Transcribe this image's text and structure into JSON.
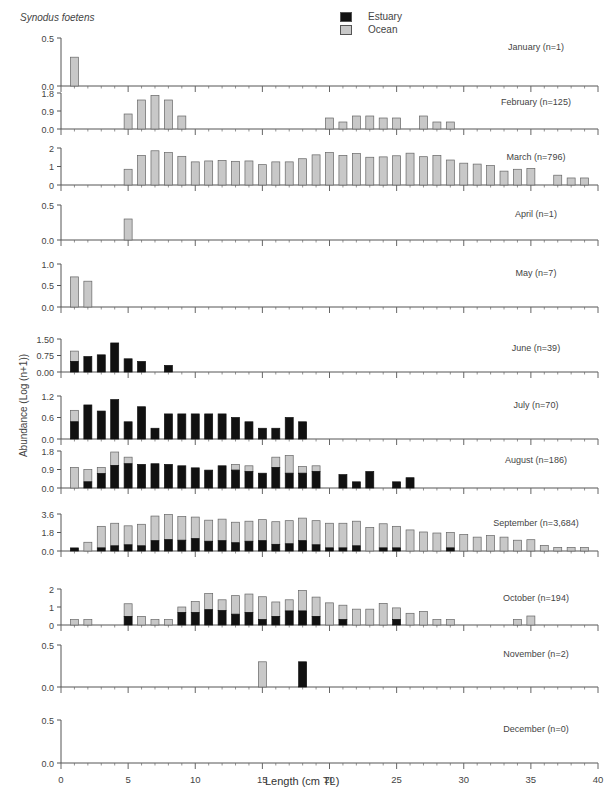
{
  "chart_data": {
    "type": "bar",
    "stacked": true,
    "title": "Synodus foetens",
    "xlabel": "Length (cm TL)",
    "ylabel": "Abundance (Log (n+1))",
    "xlim": [
      0,
      40
    ],
    "xticks": [
      0,
      5,
      10,
      15,
      20,
      25,
      30,
      35,
      40
    ],
    "legend": [
      {
        "name": "Estuary",
        "color": "#111111"
      },
      {
        "name": "Ocean",
        "color": "#c8c8c8"
      }
    ],
    "legend_position": "top-center",
    "panels": [
      {
        "label": "January (n=1)",
        "ymax": 0.5,
        "yticks": [
          "0.0",
          "0.5"
        ],
        "bars": [
          {
            "x": 1,
            "estuary": 0,
            "total": 0.3
          }
        ]
      },
      {
        "label": "February (n=125)",
        "ymax": 1.8,
        "yticks": [
          "0.0",
          "0.9",
          "1.8"
        ],
        "bars": [
          {
            "x": 5,
            "estuary": 0,
            "total": 0.75
          },
          {
            "x": 6,
            "estuary": 0,
            "total": 1.45
          },
          {
            "x": 7,
            "estuary": 0,
            "total": 1.68
          },
          {
            "x": 8,
            "estuary": 0,
            "total": 1.45
          },
          {
            "x": 9,
            "estuary": 0,
            "total": 0.65
          },
          {
            "x": 20,
            "estuary": 0,
            "total": 0.55
          },
          {
            "x": 21,
            "estuary": 0,
            "total": 0.35
          },
          {
            "x": 22,
            "estuary": 0,
            "total": 0.65
          },
          {
            "x": 23,
            "estuary": 0,
            "total": 0.65
          },
          {
            "x": 24,
            "estuary": 0,
            "total": 0.55
          },
          {
            "x": 25,
            "estuary": 0,
            "total": 0.55
          },
          {
            "x": 27,
            "estuary": 0,
            "total": 0.65
          },
          {
            "x": 28,
            "estuary": 0,
            "total": 0.35
          },
          {
            "x": 29,
            "estuary": 0,
            "total": 0.35
          }
        ]
      },
      {
        "label": "March (n=796)",
        "ymax": 2,
        "yticks": [
          "0",
          "1",
          "2"
        ],
        "bars": [
          {
            "x": 5,
            "estuary": 0,
            "total": 0.85
          },
          {
            "x": 6,
            "estuary": 0,
            "total": 1.6
          },
          {
            "x": 7,
            "estuary": 0,
            "total": 1.85
          },
          {
            "x": 8,
            "estuary": 0,
            "total": 1.75
          },
          {
            "x": 9,
            "estuary": 0,
            "total": 1.55
          },
          {
            "x": 10,
            "estuary": 0,
            "total": 1.25
          },
          {
            "x": 11,
            "estuary": 0,
            "total": 1.3
          },
          {
            "x": 12,
            "estuary": 0,
            "total": 1.33
          },
          {
            "x": 13,
            "estuary": 0,
            "total": 1.28
          },
          {
            "x": 14,
            "estuary": 0,
            "total": 1.3
          },
          {
            "x": 15,
            "estuary": 0,
            "total": 1.1
          },
          {
            "x": 16,
            "estuary": 0,
            "total": 1.25
          },
          {
            "x": 17,
            "estuary": 0,
            "total": 1.25
          },
          {
            "x": 18,
            "estuary": 0,
            "total": 1.42
          },
          {
            "x": 19,
            "estuary": 0,
            "total": 1.63
          },
          {
            "x": 20,
            "estuary": 0,
            "total": 1.75
          },
          {
            "x": 21,
            "estuary": 0,
            "total": 1.6
          },
          {
            "x": 22,
            "estuary": 0,
            "total": 1.7
          },
          {
            "x": 23,
            "estuary": 0,
            "total": 1.5
          },
          {
            "x": 24,
            "estuary": 0,
            "total": 1.52
          },
          {
            "x": 25,
            "estuary": 0,
            "total": 1.58
          },
          {
            "x": 26,
            "estuary": 0,
            "total": 1.72
          },
          {
            "x": 27,
            "estuary": 0,
            "total": 1.53
          },
          {
            "x": 28,
            "estuary": 0,
            "total": 1.6
          },
          {
            "x": 29,
            "estuary": 0,
            "total": 1.35
          },
          {
            "x": 30,
            "estuary": 0,
            "total": 1.18
          },
          {
            "x": 31,
            "estuary": 0,
            "total": 1.13
          },
          {
            "x": 32,
            "estuary": 0,
            "total": 1.05
          },
          {
            "x": 33,
            "estuary": 0,
            "total": 0.75
          },
          {
            "x": 34,
            "estuary": 0,
            "total": 0.85
          },
          {
            "x": 35,
            "estuary": 0,
            "total": 0.9
          },
          {
            "x": 37,
            "estuary": 0,
            "total": 0.53
          },
          {
            "x": 38,
            "estuary": 0,
            "total": 0.38
          },
          {
            "x": 39,
            "estuary": 0,
            "total": 0.38
          }
        ]
      },
      {
        "label": "April (n=1)",
        "ymax": 0.5,
        "yticks": [
          "0.0",
          "0.5"
        ],
        "bars": [
          {
            "x": 5,
            "estuary": 0,
            "total": 0.3
          }
        ]
      },
      {
        "label": "May (n=7)",
        "ymax": 1.0,
        "yticks": [
          "0.0",
          "0.5",
          "1.0"
        ],
        "bars": [
          {
            "x": 1,
            "estuary": 0,
            "total": 0.7
          },
          {
            "x": 2,
            "estuary": 0,
            "total": 0.6
          }
        ]
      },
      {
        "label": "June (n=39)",
        "ymax": 1.5,
        "yticks": [
          "0.00",
          "0.75",
          "1.50"
        ],
        "bars": [
          {
            "x": 1,
            "estuary": 0.48,
            "total": 0.95
          },
          {
            "x": 2,
            "estuary": 0.7,
            "total": 0.7
          },
          {
            "x": 3,
            "estuary": 0.78,
            "total": 0.78
          },
          {
            "x": 4,
            "estuary": 1.32,
            "total": 1.32
          },
          {
            "x": 5,
            "estuary": 0.6,
            "total": 0.6
          },
          {
            "x": 6,
            "estuary": 0.48,
            "total": 0.48
          },
          {
            "x": 8,
            "estuary": 0.3,
            "total": 0.3
          }
        ]
      },
      {
        "label": "July (n=70)",
        "ymax": 1.2,
        "yticks": [
          "0.0",
          "0.6",
          "1.2"
        ],
        "bars": [
          {
            "x": 1,
            "estuary": 0.48,
            "total": 0.8
          },
          {
            "x": 2,
            "estuary": 0.95,
            "total": 0.95
          },
          {
            "x": 3,
            "estuary": 0.78,
            "total": 0.78
          },
          {
            "x": 4,
            "estuary": 1.1,
            "total": 1.1
          },
          {
            "x": 5,
            "estuary": 0.48,
            "total": 0.48
          },
          {
            "x": 6,
            "estuary": 0.9,
            "total": 0.9
          },
          {
            "x": 7,
            "estuary": 0.3,
            "total": 0.3
          },
          {
            "x": 8,
            "estuary": 0.7,
            "total": 0.7
          },
          {
            "x": 9,
            "estuary": 0.7,
            "total": 0.7
          },
          {
            "x": 10,
            "estuary": 0.7,
            "total": 0.7
          },
          {
            "x": 11,
            "estuary": 0.7,
            "total": 0.7
          },
          {
            "x": 12,
            "estuary": 0.7,
            "total": 0.7
          },
          {
            "x": 13,
            "estuary": 0.6,
            "total": 0.6
          },
          {
            "x": 14,
            "estuary": 0.48,
            "total": 0.48
          },
          {
            "x": 15,
            "estuary": 0.3,
            "total": 0.3
          },
          {
            "x": 16,
            "estuary": 0.3,
            "total": 0.3
          },
          {
            "x": 17,
            "estuary": 0.6,
            "total": 0.6
          },
          {
            "x": 18,
            "estuary": 0.48,
            "total": 0.48
          }
        ]
      },
      {
        "label": "August (n=186)",
        "ymax": 1.8,
        "yticks": [
          "0.0",
          "0.9",
          "1.8"
        ],
        "bars": [
          {
            "x": 1,
            "estuary": 0,
            "total": 1.0
          },
          {
            "x": 2,
            "estuary": 0.3,
            "total": 0.9
          },
          {
            "x": 3,
            "estuary": 0.7,
            "total": 1.0
          },
          {
            "x": 4,
            "estuary": 1.1,
            "total": 1.75
          },
          {
            "x": 5,
            "estuary": 1.18,
            "total": 1.5
          },
          {
            "x": 6,
            "estuary": 1.15,
            "total": 1.15
          },
          {
            "x": 7,
            "estuary": 1.18,
            "total": 1.18
          },
          {
            "x": 8,
            "estuary": 1.15,
            "total": 1.15
          },
          {
            "x": 9,
            "estuary": 1.08,
            "total": 1.08
          },
          {
            "x": 10,
            "estuary": 0.98,
            "total": 0.98
          },
          {
            "x": 11,
            "estuary": 0.87,
            "total": 0.87
          },
          {
            "x": 12,
            "estuary": 1.08,
            "total": 1.08
          },
          {
            "x": 13,
            "estuary": 0.87,
            "total": 1.15
          },
          {
            "x": 14,
            "estuary": 0.8,
            "total": 1.08
          },
          {
            "x": 15,
            "estuary": 0.72,
            "total": 0.72
          },
          {
            "x": 16,
            "estuary": 1.0,
            "total": 1.5
          },
          {
            "x": 17,
            "estuary": 0.72,
            "total": 1.58
          },
          {
            "x": 18,
            "estuary": 0.72,
            "total": 1.05
          },
          {
            "x": 19,
            "estuary": 0.8,
            "total": 1.08
          },
          {
            "x": 21,
            "estuary": 0.65,
            "total": 0.65
          },
          {
            "x": 22,
            "estuary": 0.3,
            "total": 0.3
          },
          {
            "x": 23,
            "estuary": 0.8,
            "total": 0.8
          },
          {
            "x": 25,
            "estuary": 0.3,
            "total": 0.3
          },
          {
            "x": 26,
            "estuary": 0.5,
            "total": 0.5
          }
        ]
      },
      {
        "label": "September (n=3,684)",
        "ymax": 3.6,
        "yticks": [
          "0.0",
          "1.8",
          "3.6"
        ],
        "bars": [
          {
            "x": 1,
            "estuary": 0.3,
            "total": 0.3
          },
          {
            "x": 2,
            "estuary": 0,
            "total": 0.85
          },
          {
            "x": 3,
            "estuary": 0.3,
            "total": 2.4
          },
          {
            "x": 4,
            "estuary": 0.5,
            "total": 2.7
          },
          {
            "x": 5,
            "estuary": 0.6,
            "total": 2.45
          },
          {
            "x": 6,
            "estuary": 0.5,
            "total": 2.6
          },
          {
            "x": 7,
            "estuary": 1.0,
            "total": 3.4
          },
          {
            "x": 8,
            "estuary": 1.1,
            "total": 3.55
          },
          {
            "x": 9,
            "estuary": 1.05,
            "total": 3.35
          },
          {
            "x": 10,
            "estuary": 1.2,
            "total": 3.3
          },
          {
            "x": 11,
            "estuary": 0.95,
            "total": 3.0
          },
          {
            "x": 12,
            "estuary": 1.0,
            "total": 3.1
          },
          {
            "x": 13,
            "estuary": 0.8,
            "total": 2.8
          },
          {
            "x": 14,
            "estuary": 0.95,
            "total": 2.9
          },
          {
            "x": 15,
            "estuary": 1.0,
            "total": 3.05
          },
          {
            "x": 16,
            "estuary": 0.65,
            "total": 2.85
          },
          {
            "x": 17,
            "estuary": 0.7,
            "total": 2.95
          },
          {
            "x": 18,
            "estuary": 1.0,
            "total": 3.2
          },
          {
            "x": 19,
            "estuary": 0.6,
            "total": 2.95
          },
          {
            "x": 20,
            "estuary": 0.3,
            "total": 2.7
          },
          {
            "x": 21,
            "estuary": 0.3,
            "total": 2.7
          },
          {
            "x": 22,
            "estuary": 0.5,
            "total": 2.9
          },
          {
            "x": 23,
            "estuary": 0,
            "total": 2.3
          },
          {
            "x": 24,
            "estuary": 0.3,
            "total": 2.65
          },
          {
            "x": 25,
            "estuary": 0.3,
            "total": 2.4
          },
          {
            "x": 26,
            "estuary": 0,
            "total": 2.05
          },
          {
            "x": 27,
            "estuary": 0,
            "total": 1.85
          },
          {
            "x": 28,
            "estuary": 0,
            "total": 1.75
          },
          {
            "x": 29,
            "estuary": 0.3,
            "total": 1.8
          },
          {
            "x": 30,
            "estuary": 0,
            "total": 1.6
          },
          {
            "x": 31,
            "estuary": 0,
            "total": 1.35
          },
          {
            "x": 32,
            "estuary": 0,
            "total": 1.5
          },
          {
            "x": 33,
            "estuary": 0,
            "total": 1.35
          },
          {
            "x": 34,
            "estuary": 0,
            "total": 1.05
          },
          {
            "x": 35,
            "estuary": 0,
            "total": 1.1
          },
          {
            "x": 36,
            "estuary": 0,
            "total": 0.55
          },
          {
            "x": 37,
            "estuary": 0,
            "total": 0.35
          },
          {
            "x": 38,
            "estuary": 0,
            "total": 0.35
          },
          {
            "x": 39,
            "estuary": 0,
            "total": 0.35
          }
        ]
      },
      {
        "label": "October (n=194)",
        "ymax": 2,
        "yticks": [
          "0",
          "1",
          "2"
        ],
        "bars": [
          {
            "x": 1,
            "estuary": 0,
            "total": 0.3
          },
          {
            "x": 2,
            "estuary": 0,
            "total": 0.3
          },
          {
            "x": 5,
            "estuary": 0.48,
            "total": 1.18
          },
          {
            "x": 6,
            "estuary": 0,
            "total": 0.48
          },
          {
            "x": 7,
            "estuary": 0,
            "total": 0.3
          },
          {
            "x": 8,
            "estuary": 0,
            "total": 0.3
          },
          {
            "x": 9,
            "estuary": 0.7,
            "total": 1.0
          },
          {
            "x": 10,
            "estuary": 0.7,
            "total": 1.3
          },
          {
            "x": 11,
            "estuary": 0.85,
            "total": 1.75
          },
          {
            "x": 12,
            "estuary": 0.8,
            "total": 1.4
          },
          {
            "x": 13,
            "estuary": 0.6,
            "total": 1.63
          },
          {
            "x": 14,
            "estuary": 0.7,
            "total": 1.72
          },
          {
            "x": 15,
            "estuary": 0.3,
            "total": 1.57
          },
          {
            "x": 16,
            "estuary": 0.48,
            "total": 1.28
          },
          {
            "x": 17,
            "estuary": 0.78,
            "total": 1.4
          },
          {
            "x": 18,
            "estuary": 0.78,
            "total": 1.92
          },
          {
            "x": 19,
            "estuary": 0.48,
            "total": 1.55
          },
          {
            "x": 20,
            "estuary": 0,
            "total": 1.23
          },
          {
            "x": 21,
            "estuary": 0.3,
            "total": 1.1
          },
          {
            "x": 22,
            "estuary": 0,
            "total": 0.88
          },
          {
            "x": 23,
            "estuary": 0,
            "total": 0.88
          },
          {
            "x": 24,
            "estuary": 0,
            "total": 1.2
          },
          {
            "x": 25,
            "estuary": 0.3,
            "total": 0.95
          },
          {
            "x": 26,
            "estuary": 0,
            "total": 0.65
          },
          {
            "x": 27,
            "estuary": 0,
            "total": 0.75
          },
          {
            "x": 28,
            "estuary": 0,
            "total": 0.3
          },
          {
            "x": 29,
            "estuary": 0,
            "total": 0.3
          },
          {
            "x": 34,
            "estuary": 0,
            "total": 0.3
          },
          {
            "x": 35,
            "estuary": 0,
            "total": 0.5
          }
        ]
      },
      {
        "label": "November (n=2)",
        "ymax": 0.5,
        "yticks": [
          "0.0",
          "0.5"
        ],
        "bars": [
          {
            "x": 15,
            "estuary": 0,
            "total": 0.3
          },
          {
            "x": 18,
            "estuary": 0.3,
            "total": 0.3
          }
        ]
      },
      {
        "label": "December (n=0)",
        "ymax": 0.5,
        "yticks": [
          "0.0",
          "0.5"
        ],
        "bars": []
      }
    ]
  },
  "labels": {
    "species": "Synodus foetens",
    "legend_estuary": "Estuary",
    "legend_ocean": "Ocean",
    "ylabel": "Abundance (Log (n+1))",
    "xlabel": "Length (cm TL)"
  }
}
